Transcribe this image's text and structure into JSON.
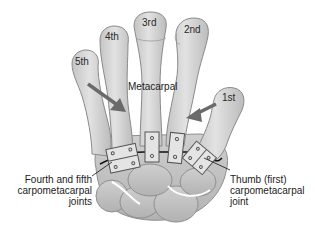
{
  "diagram": {
    "bone_labels": {
      "fifth": "5th",
      "fourth": "4th",
      "third": "3rd",
      "second": "2nd",
      "first": "1st"
    },
    "center_label": "Metacarpal",
    "left_callout": {
      "line1": "Fourth and fifth",
      "line2": "carpometacarpal",
      "line3": "joints"
    },
    "right_callout": {
      "line1": "Thumb (first)",
      "line2": "carpometacarpal",
      "line3": "joint"
    },
    "colors": {
      "bone_fill": "#d6d6d6",
      "bone_shade": "#bdbdbd",
      "bone_outline": "#8a8a8a",
      "arrow": "#6a6a6a",
      "hinge_fill": "#e4e4e4",
      "joint_line": "#111111"
    }
  }
}
